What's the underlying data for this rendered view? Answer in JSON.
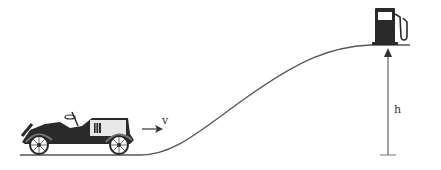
{
  "diagram": {
    "labels": {
      "velocity": "v",
      "height": "h"
    },
    "elements": {
      "vehicle": "vintage-car",
      "destination": "fuel-pump",
      "track": "hill-curve"
    },
    "colors": {
      "line": "#555555",
      "ink": "#2a2a2a",
      "background": "#ffffff"
    }
  }
}
